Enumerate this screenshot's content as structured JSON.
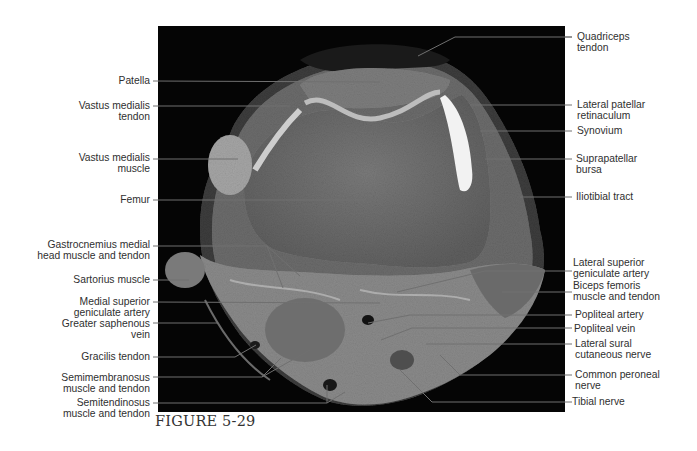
{
  "figure": {
    "caption": "FIGURE 5-29",
    "image_description": "Axial MRI cross-section of the knee"
  },
  "labels_left": [
    {
      "id": "patella",
      "lines": [
        "Patella"
      ]
    },
    {
      "id": "vastus-medialis-tendon",
      "lines": [
        "Vastus medialis",
        "tendon"
      ]
    },
    {
      "id": "vastus-medialis-muscle",
      "lines": [
        "Vastus medialis",
        "muscle"
      ]
    },
    {
      "id": "femur",
      "lines": [
        "Femur"
      ]
    },
    {
      "id": "gastrocnemius-medial-head",
      "lines": [
        "Gastrocnemius medial",
        "head muscle and tendon"
      ]
    },
    {
      "id": "sartorius-muscle",
      "lines": [
        "Sartorius muscle"
      ]
    },
    {
      "id": "medial-superior-geniculate-artery",
      "lines": [
        "Medial superior",
        "geniculate artery"
      ]
    },
    {
      "id": "greater-saphenous-vein",
      "lines": [
        "Greater saphenous",
        "vein"
      ]
    },
    {
      "id": "gracilis-tendon",
      "lines": [
        "Gracilis tendon"
      ]
    },
    {
      "id": "semimembranosus",
      "lines": [
        "Semimembranosus",
        "muscle and tendon"
      ]
    },
    {
      "id": "semitendinosus",
      "lines": [
        "Semitendinosus",
        "muscle and tendon"
      ]
    }
  ],
  "labels_right": [
    {
      "id": "quadriceps-tendon",
      "lines": [
        "Quadriceps",
        "tendon"
      ]
    },
    {
      "id": "lateral-patellar-retinaculum",
      "lines": [
        "Lateral patellar",
        "retinaculum"
      ]
    },
    {
      "id": "synovium",
      "lines": [
        "Synovium"
      ]
    },
    {
      "id": "suprapatellar-bursa",
      "lines": [
        "Suprapatellar",
        "bursa"
      ]
    },
    {
      "id": "iliotibial-tract",
      "lines": [
        "Iliotibial tract"
      ]
    },
    {
      "id": "lateral-superior-geniculate-artery",
      "lines": [
        "Lateral superior",
        "geniculate artery"
      ]
    },
    {
      "id": "biceps-femoris",
      "lines": [
        "Biceps femoris",
        "muscle and tendon"
      ]
    },
    {
      "id": "popliteal-artery",
      "lines": [
        "Popliteal artery"
      ]
    },
    {
      "id": "popliteal-vein",
      "lines": [
        "Popliteal vein"
      ]
    },
    {
      "id": "lateral-sural-cutaneous-nerve",
      "lines": [
        "Lateral sural",
        "cutaneous nerve"
      ]
    },
    {
      "id": "common-peroneal-nerve",
      "lines": [
        "Common peroneal",
        "nerve"
      ]
    },
    {
      "id": "tibial-nerve",
      "lines": [
        "Tibial nerve"
      ]
    }
  ],
  "colors": {
    "background": "#ffffff",
    "mri_frame": "#050505",
    "leader_line": "#6f6f6f",
    "text": "#2f2f2f"
  }
}
